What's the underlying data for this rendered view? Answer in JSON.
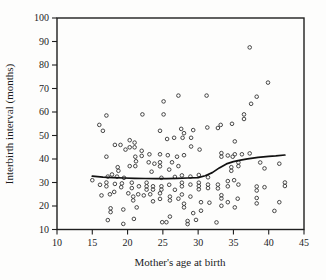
{
  "figure": {
    "xlabel": "Mother's age at birth",
    "ylabel": "Interbirth interval (months)"
  },
  "colors": {
    "background": "#fdfdfc",
    "frame": "#1f1f1f",
    "point_stroke": "#3d3d3d",
    "curve": "#111111",
    "text": "#1c1c1c"
  },
  "chart_data": {
    "type": "scatter",
    "title": "",
    "xlabel": "Mother's age at birth",
    "ylabel": "Interbirth interval (months)",
    "xlim": [
      10,
      45
    ],
    "ylim": [
      10,
      100
    ],
    "x_ticks": [
      10,
      15,
      20,
      25,
      30,
      35,
      40,
      45
    ],
    "y_ticks": [
      10,
      20,
      30,
      40,
      50,
      60,
      70,
      80,
      90,
      100
    ],
    "grid": false,
    "legend": "none",
    "marker": "open-circle",
    "series": [
      {
        "name": "interbirth-observations",
        "type": "scatter",
        "points": [
          [
            37.3,
            87.5
          ],
          [
            39.9,
            72.5
          ],
          [
            27.2,
            67
          ],
          [
            31.2,
            67
          ],
          [
            38.3,
            66.5
          ],
          [
            37.5,
            63.5
          ],
          [
            25.1,
            64.5
          ],
          [
            17,
            58.5
          ],
          [
            22.1,
            59
          ],
          [
            25.1,
            59
          ],
          [
            36.5,
            59
          ],
          [
            36.5,
            57
          ],
          [
            16,
            54.5
          ],
          [
            16.5,
            52
          ],
          [
            33.2,
            54.5
          ],
          [
            34.8,
            55
          ],
          [
            31.3,
            53.4
          ],
          [
            32.8,
            53.2
          ],
          [
            27.6,
            52.8
          ],
          [
            29.3,
            52.3
          ],
          [
            28,
            51
          ],
          [
            24.6,
            52
          ],
          [
            29,
            49
          ],
          [
            25.6,
            48.5
          ],
          [
            26.6,
            49
          ],
          [
            27.8,
            49
          ],
          [
            20.3,
            48
          ],
          [
            35.2,
            47.5
          ],
          [
            21,
            47
          ],
          [
            18.2,
            46
          ],
          [
            19,
            46
          ],
          [
            20.3,
            45
          ],
          [
            21,
            45
          ],
          [
            29,
            45.3
          ],
          [
            19.7,
            44
          ],
          [
            30.2,
            44
          ],
          [
            22,
            43.5
          ],
          [
            23.1,
            42
          ],
          [
            28,
            41.6
          ],
          [
            17,
            41
          ],
          [
            21.1,
            41
          ],
          [
            22,
            41.3
          ],
          [
            24.6,
            42
          ],
          [
            25.7,
            41.6
          ],
          [
            27,
            41
          ],
          [
            33.3,
            42.5
          ],
          [
            33.3,
            41
          ],
          [
            34.2,
            41.5
          ],
          [
            35.2,
            42
          ],
          [
            36.2,
            42
          ],
          [
            37.3,
            42.4
          ],
          [
            34.9,
            41
          ],
          [
            41.5,
            38
          ],
          [
            38.8,
            38.5
          ],
          [
            35.7,
            38.5
          ],
          [
            35.7,
            37
          ],
          [
            34.7,
            36.5
          ],
          [
            34.7,
            35
          ],
          [
            18.6,
            36.5
          ],
          [
            18.7,
            35
          ],
          [
            20.3,
            37
          ],
          [
            21.2,
            39
          ],
          [
            21.1,
            37
          ],
          [
            23,
            38.6
          ],
          [
            23.8,
            38
          ],
          [
            24.6,
            38.6
          ],
          [
            24.6,
            36.9
          ],
          [
            26.3,
            38.6
          ],
          [
            27.2,
            37
          ],
          [
            25.9,
            35.5
          ],
          [
            23.4,
            34.6
          ],
          [
            39.4,
            36
          ],
          [
            15,
            31
          ],
          [
            17.2,
            32.5
          ],
          [
            17.8,
            33.4
          ],
          [
            18.5,
            32.5
          ],
          [
            19.5,
            32
          ],
          [
            24.8,
            32
          ],
          [
            26.7,
            32.4
          ],
          [
            27.7,
            33
          ],
          [
            28.9,
            32.5
          ],
          [
            30.1,
            33.2
          ],
          [
            31.4,
            32.2
          ],
          [
            34.2,
            30.6
          ],
          [
            35.1,
            31
          ],
          [
            42.3,
            30
          ],
          [
            42.3,
            28.5
          ],
          [
            16.1,
            29
          ],
          [
            17,
            30
          ],
          [
            17,
            28.4
          ],
          [
            18.2,
            29.4
          ],
          [
            19.1,
            28
          ],
          [
            19.2,
            29.6
          ],
          [
            20.6,
            29.9
          ],
          [
            20.6,
            27.6
          ],
          [
            21.6,
            28.4
          ],
          [
            22.7,
            29.9
          ],
          [
            22.7,
            28.4
          ],
          [
            22.7,
            27
          ],
          [
            23.6,
            28.4
          ],
          [
            23.6,
            27
          ],
          [
            24.8,
            28.4
          ],
          [
            24.8,
            27
          ],
          [
            25.9,
            29
          ],
          [
            26.7,
            26.9
          ],
          [
            27.7,
            29.9
          ],
          [
            27.7,
            28.4
          ],
          [
            28.9,
            29.1
          ],
          [
            30.1,
            29.9
          ],
          [
            30.1,
            28.5
          ],
          [
            30.1,
            27.1
          ],
          [
            31.4,
            29.1
          ],
          [
            31.4,
            27.6
          ],
          [
            32.8,
            29.1
          ],
          [
            32.8,
            27.5
          ],
          [
            34.2,
            28.4
          ],
          [
            35.7,
            29.1
          ],
          [
            38.3,
            28.3
          ],
          [
            38.3,
            26.6
          ],
          [
            39.4,
            28
          ],
          [
            16.3,
            24.5
          ],
          [
            17.5,
            25
          ],
          [
            18.1,
            26
          ],
          [
            20.1,
            25.4
          ],
          [
            21.5,
            25
          ],
          [
            23.2,
            25
          ],
          [
            24.6,
            25.4
          ],
          [
            27.7,
            24.9
          ],
          [
            28.9,
            24
          ],
          [
            33.3,
            24.6
          ],
          [
            33.3,
            23.2
          ],
          [
            34.2,
            21.6
          ],
          [
            17.6,
            19
          ],
          [
            17.6,
            17.4
          ],
          [
            19.4,
            18.5
          ],
          [
            20.8,
            24
          ],
          [
            20.8,
            22.4
          ],
          [
            21.3,
            19.4
          ],
          [
            22.3,
            24.5
          ],
          [
            23.6,
            22
          ],
          [
            24.6,
            23
          ],
          [
            26,
            24
          ],
          [
            26,
            22.4
          ],
          [
            27.2,
            23.1
          ],
          [
            28,
            21
          ],
          [
            28,
            19.4
          ],
          [
            30.4,
            21.6
          ],
          [
            31.6,
            21.4
          ],
          [
            33.3,
            20.1
          ],
          [
            35.2,
            19.4
          ],
          [
            35.6,
            23.1
          ],
          [
            38.3,
            23.4
          ],
          [
            38.3,
            21.1
          ],
          [
            29.3,
            17
          ],
          [
            30.4,
            18
          ],
          [
            40.8,
            17.9
          ],
          [
            41.5,
            21.6
          ],
          [
            26,
            15.5
          ],
          [
            17.2,
            14
          ],
          [
            19.4,
            12.4
          ],
          [
            20.9,
            14.5
          ],
          [
            24.9,
            13.1
          ],
          [
            25.5,
            13.1
          ],
          [
            28.5,
            13.6
          ],
          [
            28.5,
            12.3
          ],
          [
            29.7,
            14.1
          ],
          [
            32.6,
            13
          ]
        ]
      },
      {
        "name": "smoothed-trend",
        "type": "line",
        "points": [
          [
            15,
            32.7
          ],
          [
            16.5,
            32.3
          ],
          [
            18,
            32.1
          ],
          [
            19.5,
            31.9
          ],
          [
            21,
            31.8
          ],
          [
            22.5,
            31.7
          ],
          [
            24,
            31.6
          ],
          [
            25.5,
            31.6
          ],
          [
            27,
            31.8
          ],
          [
            28.5,
            31.9
          ],
          [
            30,
            32.1
          ],
          [
            31,
            32.9
          ],
          [
            32,
            34.2
          ],
          [
            33,
            36.2
          ],
          [
            34,
            37.9
          ],
          [
            35,
            38.9
          ],
          [
            36,
            39.5
          ],
          [
            37,
            40.1
          ],
          [
            38.5,
            40.7
          ],
          [
            40,
            41.1
          ],
          [
            41,
            41.3
          ],
          [
            42.3,
            41.7
          ]
        ]
      }
    ]
  }
}
